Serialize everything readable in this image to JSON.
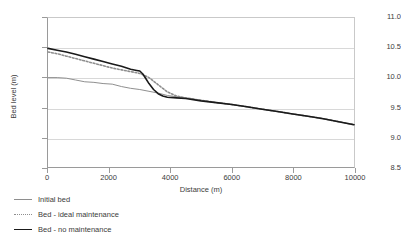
{
  "chart_data": {
    "type": "line",
    "title": "",
    "xlabel": "Distance (m)",
    "ylabel": "Bed level (m)",
    "xlim": [
      0,
      10000
    ],
    "ylim": [
      8.5,
      11.0
    ],
    "xticks": [
      0,
      2000,
      4000,
      6000,
      8000,
      10000
    ],
    "yticks": [
      8.5,
      9.0,
      9.5,
      10.0,
      10.5,
      11.0
    ],
    "xtick_labels": [
      "0",
      "2000",
      "4000",
      "6000",
      "8000",
      "10000"
    ],
    "ytick_labels": [
      "8.5",
      "9.0",
      "9.5",
      "10.0",
      "10.5",
      "11.0"
    ],
    "grid": "horizontal",
    "legend_position": "below-left",
    "series": [
      {
        "name": "Initial bed",
        "color": "#8e8e8e",
        "style": "solid",
        "width": 1.0,
        "x": [
          0,
          300,
          600,
          900,
          1200,
          1500,
          1800,
          2100,
          2400,
          2700,
          3000,
          3300,
          3600,
          3900,
          4200,
          4500,
          5000,
          5500,
          6000,
          6500,
          7000,
          7500,
          8000,
          8500,
          9000,
          9500,
          10000
        ],
        "y": [
          10.0,
          10.0,
          9.99,
          9.96,
          9.93,
          9.92,
          9.9,
          9.89,
          9.85,
          9.82,
          9.8,
          9.77,
          9.74,
          9.7,
          9.68,
          9.66,
          9.62,
          9.58,
          9.55,
          9.51,
          9.47,
          9.43,
          9.39,
          9.35,
          9.31,
          9.26,
          9.21
        ]
      },
      {
        "name": "Bed - ideal maintenance",
        "color": "#8e8e8e",
        "style": "dotted",
        "width": 1.6,
        "x": [
          0,
          300,
          600,
          900,
          1200,
          1500,
          1800,
          2100,
          2400,
          2700,
          3000,
          3300,
          3600,
          3900,
          4200,
          4500,
          5000,
          5500,
          6000,
          6500,
          7000,
          7500,
          8000,
          8500,
          9000,
          9500,
          10000
        ],
        "y": [
          10.43,
          10.4,
          10.36,
          10.32,
          10.28,
          10.24,
          10.2,
          10.16,
          10.13,
          10.1,
          10.07,
          10.0,
          9.88,
          9.76,
          9.69,
          9.66,
          9.62,
          9.58,
          9.55,
          9.51,
          9.47,
          9.43,
          9.39,
          9.35,
          9.31,
          9.26,
          9.21
        ]
      },
      {
        "name": "Bed - no maintenance",
        "color": "#1a1a1a",
        "style": "solid",
        "width": 1.6,
        "x": [
          0,
          300,
          600,
          900,
          1200,
          1500,
          1800,
          2100,
          2400,
          2700,
          2900,
          3000,
          3100,
          3200,
          3300,
          3450,
          3600,
          3750,
          3900,
          4200,
          4500,
          5000,
          5500,
          6000,
          6500,
          7000,
          7500,
          8000,
          8500,
          9000,
          9500,
          10000
        ],
        "y": [
          10.49,
          10.46,
          10.43,
          10.39,
          10.35,
          10.31,
          10.27,
          10.23,
          10.19,
          10.14,
          10.12,
          10.11,
          10.06,
          9.98,
          9.9,
          9.8,
          9.73,
          9.69,
          9.67,
          9.66,
          9.65,
          9.61,
          9.58,
          9.55,
          9.51,
          9.47,
          9.43,
          9.39,
          9.35,
          9.31,
          9.26,
          9.21
        ]
      }
    ]
  },
  "legend": {
    "items": [
      {
        "label": "Initial bed"
      },
      {
        "label": "Bed - ideal maintenance"
      },
      {
        "label": "Bed - no maintenance"
      }
    ]
  }
}
